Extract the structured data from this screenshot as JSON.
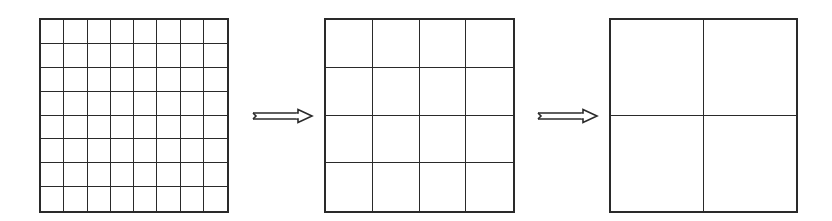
{
  "diagram": {
    "line_color": "#2a2a2a",
    "background": "#ffffff",
    "grids": [
      {
        "id": "grid-8",
        "rows": 8,
        "cols": 8
      },
      {
        "id": "grid-4",
        "rows": 4,
        "cols": 4
      },
      {
        "id": "grid-2",
        "rows": 2,
        "cols": 2
      }
    ],
    "arrows": [
      {
        "id": "arrow-1",
        "from": "grid-8",
        "to": "grid-4",
        "style": "double-line hollow arrow"
      },
      {
        "id": "arrow-2",
        "from": "grid-4",
        "to": "grid-2",
        "style": "double-line hollow arrow"
      }
    ]
  }
}
